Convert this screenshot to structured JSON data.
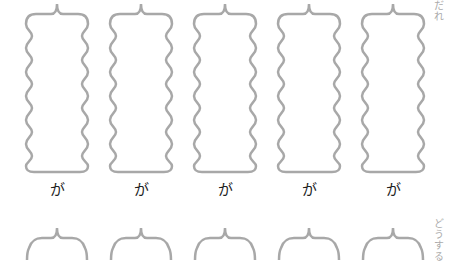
{
  "worksheet": {
    "row1": {
      "side_label": "だれ",
      "boxes": [
        {
          "particle": "が"
        },
        {
          "particle": "が"
        },
        {
          "particle": "が"
        },
        {
          "particle": "が"
        },
        {
          "particle": "が"
        }
      ]
    },
    "row2": {
      "side_label": "どうする",
      "boxes": [
        {},
        {},
        {},
        {},
        {}
      ]
    },
    "colors": {
      "frame_stroke": "#a8a8a8",
      "particle_text": "#222222",
      "side_label_text": "#aaaaaa"
    }
  }
}
